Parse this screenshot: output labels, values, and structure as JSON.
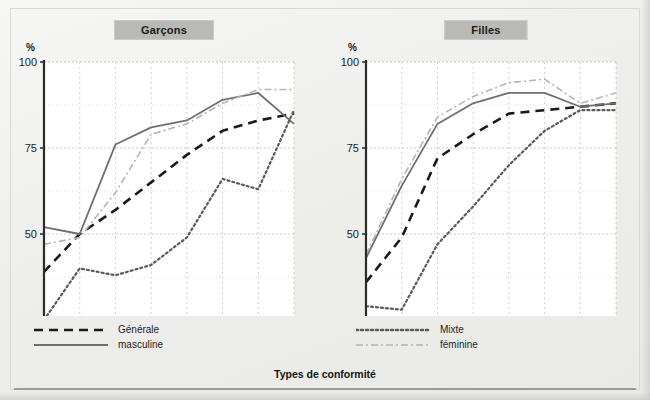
{
  "figure": {
    "footer_title": "Types de conformité",
    "percent_symbol": "%",
    "x_unit_label": "ans"
  },
  "panels": [
    {
      "id": "garcons",
      "title": "Garçons"
    },
    {
      "id": "filles",
      "title": "Filles"
    }
  ],
  "legend": {
    "left": [
      {
        "key": "generale",
        "label": "Générale",
        "style": "dashed",
        "color": "#1a1a1a"
      },
      {
        "key": "masculine",
        "label": "masculine",
        "style": "solid",
        "color": "#6f6f6f"
      }
    ],
    "right": [
      {
        "key": "mixte",
        "label": "Mixte",
        "style": "dotted",
        "color": "#5a5a5a"
      },
      {
        "key": "feminine",
        "label": "féminine",
        "style": "dashdot",
        "color": "#b4b4b4"
      }
    ]
  },
  "colors": {
    "generale": "#1a1a1a",
    "masculine": "#6f6f6f",
    "mixte": "#5a5a5a",
    "feminine": "#b4b4b4",
    "axis": "#2b2b2b",
    "grid": "#b6b6b2",
    "plot_bg": "#ffffff",
    "badge_bg": "#b9b9b6",
    "page_bg": "#efefed"
  },
  "chart_data": [
    {
      "type": "line",
      "title": "Garçons",
      "xlabel": "ans",
      "ylabel": "%",
      "x": [
        3,
        4,
        5,
        6,
        7,
        8,
        9,
        10
      ],
      "xlim": [
        3,
        10
      ],
      "ylim": [
        25,
        100
      ],
      "yticks": [
        25,
        50,
        75,
        100
      ],
      "xticks": [
        3,
        4,
        5,
        6,
        7,
        8,
        9,
        10
      ],
      "grid": true,
      "legend_position": "below-left",
      "series": [
        {
          "name": "Générale",
          "values": [
            39,
            50,
            57,
            65,
            73,
            80,
            83,
            85
          ]
        },
        {
          "name": "masculine",
          "values": [
            52,
            50,
            76,
            81,
            83,
            89,
            91,
            82
          ]
        },
        {
          "name": "Mixte",
          "values": [
            25,
            40,
            38,
            41,
            49,
            66,
            63,
            86
          ]
        },
        {
          "name": "féminine",
          "values": [
            47,
            49,
            62,
            79,
            82,
            88,
            92,
            92
          ]
        }
      ]
    },
    {
      "type": "line",
      "title": "Filles",
      "xlabel": "ans",
      "ylabel": "%",
      "x": [
        3,
        4,
        5,
        6,
        7,
        8,
        9,
        10
      ],
      "xlim": [
        3,
        10
      ],
      "ylim": [
        25,
        100
      ],
      "yticks": [
        25,
        50,
        75,
        100
      ],
      "xticks": [
        3,
        4,
        5,
        6,
        7,
        8,
        9,
        10
      ],
      "grid": true,
      "legend_position": "below-left",
      "series": [
        {
          "name": "Générale",
          "values": [
            36,
            49,
            72,
            79,
            85,
            86,
            87,
            88
          ]
        },
        {
          "name": "masculine",
          "values": [
            43,
            64,
            82,
            88,
            91,
            91,
            87,
            88
          ]
        },
        {
          "name": "Mixte",
          "values": [
            29,
            28,
            47,
            58,
            70,
            80,
            86,
            86
          ]
        },
        {
          "name": "féminine",
          "values": [
            44,
            66,
            84,
            90,
            94,
            95,
            88,
            91
          ]
        }
      ]
    }
  ]
}
